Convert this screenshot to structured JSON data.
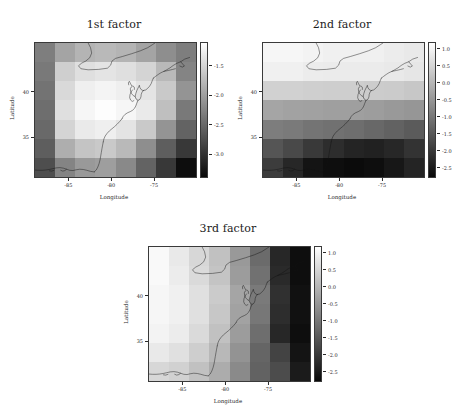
{
  "figure": {
    "background": "#ffffff",
    "colormap": "grayscale-inverted"
  },
  "chart_data": [
    {
      "type": "heatmap",
      "title": "1st factor",
      "xlabel": "Longitude",
      "ylabel": "Latitude",
      "xticks": [
        "-85",
        "-80",
        "-75"
      ],
      "xtick_values": [
        -85,
        -80,
        -75
      ],
      "yticks": [
        "40",
        "35"
      ],
      "ytick_values": [
        40,
        35
      ],
      "xlim": [
        -89,
        -70
      ],
      "ylim": [
        30.5,
        45.5
      ],
      "grid": false,
      "legend": "colorbar-right",
      "colorbar_ticks": [
        "-1.5",
        "-2.0",
        "-2.5",
        "-3.0"
      ],
      "colorbar_tick_values": [
        -1.5,
        -2.0,
        -2.5,
        -3.0
      ],
      "zlim": [
        -3.4,
        -1.1
      ],
      "ncols": 8,
      "nrows": 7,
      "values": [
        [
          -2.3,
          -1.95,
          -1.8,
          -1.75,
          -1.8,
          -1.95,
          -2.15,
          -2.3
        ],
        [
          -2.35,
          -1.55,
          -1.4,
          -1.35,
          -1.4,
          -1.5,
          -1.75,
          -2.25
        ],
        [
          -2.4,
          -1.45,
          -1.25,
          -1.2,
          -1.25,
          -1.35,
          -1.6,
          -2.1
        ],
        [
          -2.45,
          -1.4,
          -1.18,
          -1.12,
          -1.18,
          -1.3,
          -1.7,
          -2.35
        ],
        [
          -2.5,
          -1.5,
          -1.3,
          -1.25,
          -1.35,
          -1.6,
          -2.1,
          -2.55
        ],
        [
          -2.6,
          -1.85,
          -1.65,
          -1.6,
          -1.75,
          -2.15,
          -2.6,
          -2.95
        ],
        [
          -2.75,
          -2.25,
          -2.05,
          -2.0,
          -2.2,
          -2.55,
          -2.95,
          -3.35
        ]
      ]
    },
    {
      "type": "heatmap",
      "title": "2nd factor",
      "xlabel": "Longitude",
      "ylabel": "Latitude",
      "xticks": [
        "-85",
        "-80",
        "-75"
      ],
      "xtick_values": [
        -85,
        -80,
        -75
      ],
      "yticks": [
        "40",
        "35"
      ],
      "ytick_values": [
        40,
        35
      ],
      "xlim": [
        -89,
        -70
      ],
      "ylim": [
        30.5,
        45.5
      ],
      "grid": false,
      "legend": "colorbar-right",
      "colorbar_ticks": [
        "1.0",
        "0.5",
        "0.0",
        "-0.5",
        "-1.0",
        "-1.5",
        "-2.0",
        "-2.5"
      ],
      "colorbar_tick_values": [
        1.0,
        0.5,
        0.0,
        -0.5,
        -1.0,
        -1.5,
        -2.0,
        -2.5
      ],
      "zlim": [
        -2.8,
        1.2
      ],
      "ncols": 8,
      "nrows": 7,
      "values": [
        [
          1.05,
          1.05,
          1.0,
          0.95,
          0.95,
          0.95,
          0.9,
          0.85
        ],
        [
          0.95,
          0.95,
          0.9,
          0.88,
          0.88,
          0.88,
          0.85,
          0.8
        ],
        [
          0.45,
          0.45,
          0.42,
          0.4,
          0.4,
          0.38,
          0.35,
          0.3
        ],
        [
          -0.25,
          -0.3,
          -0.32,
          -0.35,
          -0.35,
          -0.38,
          -0.45,
          -0.5
        ],
        [
          -0.9,
          -0.95,
          -1.05,
          -1.1,
          -1.15,
          -1.25,
          -1.35,
          -1.45
        ],
        [
          -1.55,
          -1.75,
          -2.0,
          -2.2,
          -2.35,
          -2.4,
          -2.3,
          -2.1
        ],
        [
          -1.95,
          -2.3,
          -2.6,
          -2.7,
          -2.75,
          -2.7,
          -2.55,
          -2.35
        ]
      ]
    },
    {
      "type": "heatmap",
      "title": "3rd factor",
      "xlabel": "Longitude",
      "ylabel": "Latitude",
      "xticks": [
        "-85",
        "-80",
        "-75"
      ],
      "xtick_values": [
        -85,
        -80,
        -75
      ],
      "yticks": [
        "40",
        "35"
      ],
      "ytick_values": [
        40,
        35
      ],
      "xlim": [
        -89,
        -70
      ],
      "ylim": [
        30.5,
        45.5
      ],
      "grid": false,
      "legend": "colorbar-right",
      "colorbar_ticks": [
        "1.0",
        "0.5",
        "0.0",
        "-0.5",
        "-1.0",
        "-1.5",
        "-2.0",
        "-2.5"
      ],
      "colorbar_tick_values": [
        1.0,
        0.5,
        0.0,
        -0.5,
        -1.0,
        -1.5,
        -2.0,
        -2.5
      ],
      "zlim": [
        -2.8,
        1.2
      ],
      "ncols": 8,
      "nrows": 7,
      "values": [
        [
          1.1,
          0.85,
          0.55,
          0.2,
          -0.45,
          -1.2,
          -2.3,
          -2.7
        ],
        [
          1.1,
          0.9,
          0.6,
          0.25,
          -0.4,
          -1.1,
          -2.25,
          -2.7
        ],
        [
          1.05,
          0.95,
          0.7,
          0.35,
          -0.25,
          -0.95,
          -2.15,
          -2.65
        ],
        [
          1.05,
          0.95,
          0.7,
          0.3,
          -0.3,
          -1.0,
          -2.2,
          -2.65
        ],
        [
          1.0,
          0.9,
          0.6,
          0.2,
          -0.4,
          -1.15,
          -2.3,
          -2.7
        ],
        [
          0.85,
          0.7,
          0.4,
          0.05,
          -0.55,
          -1.3,
          -1.85,
          -2.6
        ],
        [
          0.55,
          0.45,
          0.2,
          -0.15,
          -0.7,
          -1.35,
          -1.7,
          -2.5
        ]
      ]
    }
  ]
}
